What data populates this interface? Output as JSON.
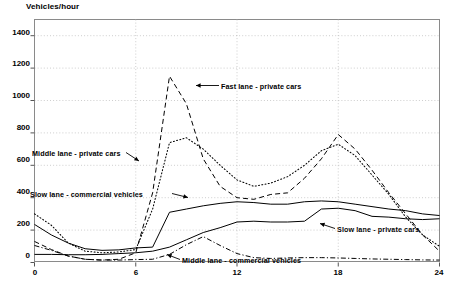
{
  "chart_data": {
    "type": "line",
    "title": "Vehicles/hour",
    "xlabel": "",
    "ylabel": "Vehicles/hour",
    "xlim": [
      0,
      24
    ],
    "ylim": [
      0,
      1500
    ],
    "yticks": [
      0,
      200,
      400,
      600,
      800,
      1000,
      1200,
      1400
    ],
    "xticks": [
      0,
      6,
      12,
      18,
      24
    ],
    "grid": true,
    "legend_position": "inline-annotations",
    "x": [
      0,
      1,
      2,
      3,
      4,
      5,
      6,
      7,
      8,
      9,
      10,
      11,
      12,
      13,
      14,
      15,
      16,
      17,
      18,
      19,
      20,
      21,
      22,
      23,
      24
    ],
    "series": [
      {
        "name": "Fast lane - private cars",
        "style": "dashed",
        "values": [
          130,
          80,
          40,
          20,
          15,
          20,
          60,
          430,
          1150,
          980,
          640,
          470,
          400,
          390,
          420,
          430,
          520,
          640,
          790,
          700,
          570,
          430,
          300,
          170,
          70
        ]
      },
      {
        "name": "Middle lane - private cars",
        "style": "dotted",
        "values": [
          300,
          230,
          120,
          70,
          60,
          65,
          80,
          330,
          740,
          770,
          700,
          600,
          510,
          470,
          490,
          530,
          600,
          690,
          730,
          660,
          540,
          420,
          280,
          170,
          100
        ]
      },
      {
        "name": "Slow lane - commercial vehicles",
        "style": "solid",
        "values": [
          235,
          170,
          120,
          85,
          75,
          78,
          90,
          95,
          310,
          330,
          350,
          365,
          375,
          370,
          360,
          360,
          375,
          380,
          375,
          360,
          345,
          330,
          320,
          300,
          290
        ]
      },
      {
        "name": "Slow lane - private cars",
        "style": "solid",
        "values": [
          50,
          50,
          48,
          48,
          50,
          55,
          60,
          70,
          95,
          140,
          185,
          215,
          250,
          255,
          250,
          250,
          255,
          330,
          335,
          320,
          285,
          280,
          270,
          265,
          270
        ]
      },
      {
        "name": "Middle lane - commercial vehicles",
        "style": "dash-dot",
        "values": [
          105,
          75,
          40,
          20,
          15,
          15,
          18,
          20,
          50,
          110,
          160,
          105,
          55,
          30,
          25,
          28,
          30,
          30,
          28,
          25,
          22,
          20,
          18,
          16,
          15
        ]
      }
    ],
    "annotations": [
      {
        "id": "fast-lane-private-cars",
        "text": "Fast lane - private cars"
      },
      {
        "id": "middle-lane-private-cars",
        "text": "Middle lane - private cars"
      },
      {
        "id": "slow-lane-commercial-vehicles",
        "text": "Slow lane - commercial vehicles"
      },
      {
        "id": "slow-lane-private-cars",
        "text": "Slow lane - private cars"
      },
      {
        "id": "middle-lane-commercial-vehicles",
        "text": "Middle lane - commercial vehicles"
      }
    ]
  },
  "axis": {
    "y_labels": [
      "1400",
      "1200",
      "1000",
      "800",
      "600",
      "400",
      "200",
      "0"
    ],
    "x_labels": [
      "0",
      "6",
      "12",
      "18",
      "24"
    ]
  },
  "colors": {
    "ink": "#000000",
    "frame": "#8a8a8a",
    "grid": "#b9b9b9",
    "background": "#ffffff"
  }
}
